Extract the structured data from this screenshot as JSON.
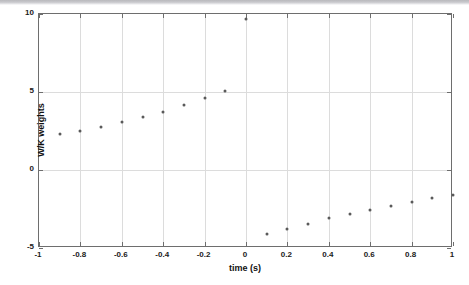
{
  "figure": {
    "background_color": "#ffffff",
    "axis_color": "#6e6e6e",
    "grid_color": "#dcdcdc",
    "marker_color": "#5a5a5a"
  },
  "chart_data": {
    "type": "scatter",
    "title": "",
    "xlabel": "time  (s)",
    "ylabel": "W/K weights",
    "xlim": [
      -1,
      1
    ],
    "ylim": [
      -5,
      10
    ],
    "xticks": [
      -1,
      -0.8,
      -0.6,
      -0.4,
      -0.2,
      0,
      0.2,
      0.4,
      0.6,
      0.8,
      1
    ],
    "xticklabels": [
      "-1",
      "-0.8",
      "-0.6",
      "-0.4",
      "-0.2",
      "0",
      "0.2",
      "0.4",
      "0.6",
      "0.8",
      "1"
    ],
    "yticks": [
      -5,
      0,
      5,
      10
    ],
    "yticklabels": [
      "-5",
      "0",
      "5",
      "10"
    ],
    "grid": true,
    "legend": false,
    "marker": "dot",
    "points": [
      {
        "x": -0.9,
        "y": 2.3
      },
      {
        "x": -0.8,
        "y": 2.5
      },
      {
        "x": -0.7,
        "y": 2.75
      },
      {
        "x": -0.6,
        "y": 3.05
      },
      {
        "x": -0.5,
        "y": 3.4
      },
      {
        "x": -0.4,
        "y": 3.75
      },
      {
        "x": -0.3,
        "y": 4.15
      },
      {
        "x": -0.2,
        "y": 4.6
      },
      {
        "x": -0.1,
        "y": 5.05
      },
      {
        "x": 0.0,
        "y": 9.65
      },
      {
        "x": 0.1,
        "y": -4.1
      },
      {
        "x": 0.2,
        "y": -3.8
      },
      {
        "x": 0.3,
        "y": -3.45
      },
      {
        "x": 0.4,
        "y": -3.1
      },
      {
        "x": 0.5,
        "y": -2.85
      },
      {
        "x": 0.6,
        "y": -2.55
      },
      {
        "x": 0.7,
        "y": -2.3
      },
      {
        "x": 0.8,
        "y": -2.05
      },
      {
        "x": 0.9,
        "y": -1.8
      },
      {
        "x": 1.0,
        "y": -1.6
      }
    ]
  }
}
